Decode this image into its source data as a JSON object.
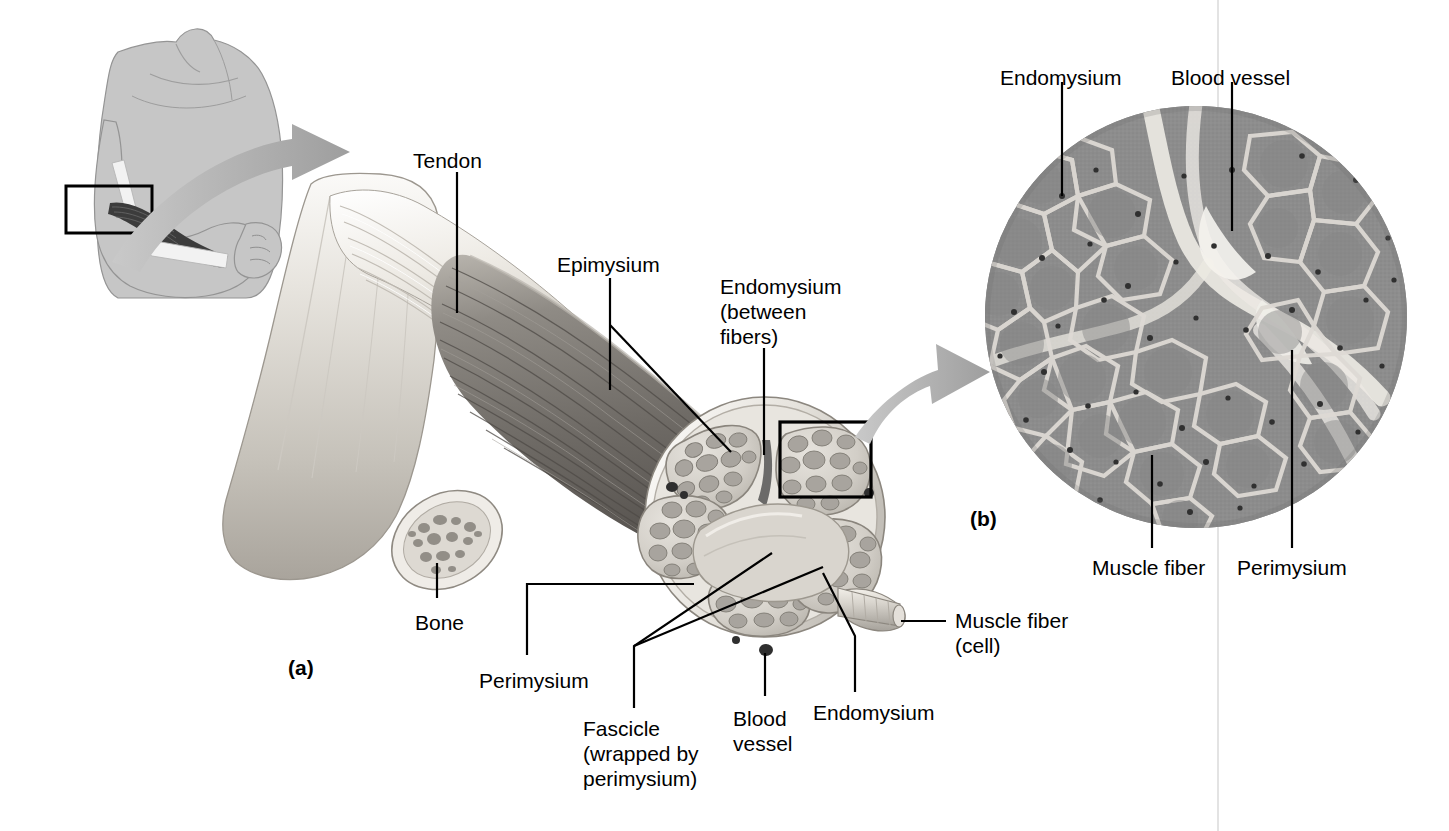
{
  "figure": {
    "panels": [
      {
        "id": "a",
        "label": "(a)",
        "x": 288,
        "y": 660,
        "description": "Illustration of skeletal muscle attached to bone by tendon, cut away to show epimysium, perimysium, fascicles, endomysium and muscle fibers"
      },
      {
        "id": "b",
        "label": "(b)",
        "x": 970,
        "y": 506,
        "description": "Light micrograph of a cross section of skeletal muscle showing muscle fibers, endomysium, perimysium and a blood vessel"
      }
    ],
    "labels": [
      {
        "id": "tendon",
        "text": "Tendon",
        "x": 413,
        "y": 148,
        "align": "left",
        "panel": "a"
      },
      {
        "id": "epimysium",
        "text": "Epimysium",
        "x": 557,
        "y": 252,
        "align": "left",
        "panel": "a"
      },
      {
        "id": "endomysium-fibers",
        "text": "Endomysium\n(between\nfibers)",
        "x": 720,
        "y": 274,
        "align": "left",
        "panel": "a"
      },
      {
        "id": "bone",
        "text": "Bone",
        "x": 415,
        "y": 610,
        "align": "left",
        "panel": "a"
      },
      {
        "id": "perimysium-a",
        "text": "Perimysium",
        "x": 479,
        "y": 668,
        "align": "left",
        "panel": "a"
      },
      {
        "id": "fascicle",
        "text": "Fascicle\n(wrapped by\nperimysium)",
        "x": 583,
        "y": 716,
        "align": "left",
        "panel": "a"
      },
      {
        "id": "blood-vessel-a",
        "text": "Blood\nvessel",
        "x": 733,
        "y": 706,
        "align": "left",
        "panel": "a"
      },
      {
        "id": "endomysium-a",
        "text": "Endomysium",
        "x": 813,
        "y": 700,
        "align": "left",
        "panel": "a"
      },
      {
        "id": "muscle-fiber-cell",
        "text": "Muscle fiber\n(cell)",
        "x": 955,
        "y": 608,
        "align": "left",
        "panel": "a"
      },
      {
        "id": "endomysium-b",
        "text": "Endomysium",
        "x": 1000,
        "y": 65,
        "align": "left",
        "panel": "b"
      },
      {
        "id": "blood-vessel-b",
        "text": "Blood vessel",
        "x": 1171,
        "y": 65,
        "align": "left",
        "panel": "b"
      },
      {
        "id": "muscle-fiber-b",
        "text": "Muscle fiber",
        "x": 1092,
        "y": 555,
        "align": "left",
        "panel": "b"
      },
      {
        "id": "perimysium-b",
        "text": "Perimysium",
        "x": 1237,
        "y": 555,
        "align": "left",
        "panel": "b"
      }
    ],
    "leaders": [
      {
        "id": "tendon-leader",
        "points": "457,172 457,313"
      },
      {
        "id": "epimysium-leader",
        "points": "610,278 610,390"
      },
      {
        "id": "epimysium-leader-2",
        "points": "610,325 731,450"
      },
      {
        "id": "endomysium-fibers-leader",
        "points": "764,348 764,455"
      },
      {
        "id": "bone-leader",
        "points": "437,598 437,563"
      },
      {
        "id": "perimysium-a-leader",
        "points": "527,655 527,584 694,584"
      },
      {
        "id": "fascicle-leader",
        "points": "634,706 634,645 772,553"
      },
      {
        "id": "fascicle-leader-2",
        "points": "634,645 821,566"
      },
      {
        "id": "blood-vessel-a-leader",
        "points": "765,694 765,653"
      },
      {
        "id": "endomysium-a-leader",
        "points": "855,690 855,635 822,572"
      },
      {
        "id": "muscle-fiber-leader",
        "points": "946,621 901,621"
      },
      {
        "id": "endomysium-b-leader",
        "points": "1062,82 1062,196"
      },
      {
        "id": "blood-vessel-b-leader",
        "points": "1232,82 1232,231"
      },
      {
        "id": "muscle-fiber-b-leader",
        "points": "1152,548 1152,455"
      },
      {
        "id": "perimysium-b-leader",
        "points": "1292,548 1292,350"
      }
    ],
    "inset_boxes": [
      {
        "id": "arm-inset-box",
        "x": 66,
        "y": 186,
        "w": 86,
        "h": 47
      },
      {
        "id": "micrograph-inset-box",
        "x": 780,
        "y": 422,
        "w": 91,
        "h": 75
      }
    ],
    "arrows": [
      {
        "id": "arm-to-muscle-arrow",
        "from": "arm-inset",
        "to": "muscle-illustration"
      },
      {
        "id": "muscle-to-micrograph-arrow",
        "from": "micrograph-inset-box",
        "to": "micrograph-circle"
      }
    ],
    "micrograph": {
      "id": "micrograph-circle",
      "cx": 1196,
      "cy": 317,
      "r": 211,
      "description": "Cross-sectional light micrograph of skeletal muscle: polygonal gray muscle fibers separated by pale endomysium, broad pale perimysium bands and a central blood vessel"
    },
    "gutter_line": {
      "x": 1218,
      "y1": 0,
      "y2": 831
    }
  },
  "colors": {
    "background": "#ffffff",
    "ink": "#000000",
    "arrow_gray": "#a9a9a9",
    "arm_gray": "#c2c2c2",
    "arm_outline": "#8c8c8c",
    "bone_light": "#e3e0da",
    "bone_mid": "#c9c5be",
    "tendon_light": "#efece6",
    "muscle_dark": "#8a8a8a",
    "muscle_darker": "#6a6a6a",
    "fascicle_fill": "#cfccc5",
    "fiber_fill": "#a9a5a0",
    "micrograph_fiber": "#8e8e8e",
    "micrograph_connective": "#dedad4",
    "gutter": "#d8d8d8"
  }
}
